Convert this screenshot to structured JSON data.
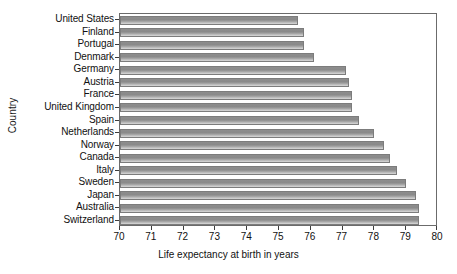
{
  "chart_data": {
    "type": "bar",
    "orientation": "horizontal",
    "title": "",
    "xlabel": "Life expectancy at birth in years",
    "ylabel": "Country",
    "xlim": [
      70,
      80
    ],
    "grid": false,
    "legend": "none",
    "xticks": [
      "70",
      "71",
      "72",
      "73",
      "74",
      "75",
      "76",
      "77",
      "78",
      "79",
      "80"
    ],
    "categories": [
      "United States",
      "Finland",
      "Portugal",
      "Denmark",
      "Germany",
      "Austria",
      "France",
      "United Kingdom",
      "Spain",
      "Netherlands",
      "Norway",
      "Canada",
      "Italy",
      "Sweden",
      "Japan",
      "Australia",
      "Switzerland"
    ],
    "values": [
      75.6,
      75.8,
      75.8,
      76.1,
      77.1,
      77.2,
      77.3,
      77.3,
      77.5,
      78.0,
      78.3,
      78.5,
      78.7,
      79.0,
      79.3,
      79.4,
      79.4
    ],
    "bar_color": "#9a9a9a",
    "bar_edge_color": "#7c7c7c",
    "axis_color": "#6b6b6b"
  }
}
